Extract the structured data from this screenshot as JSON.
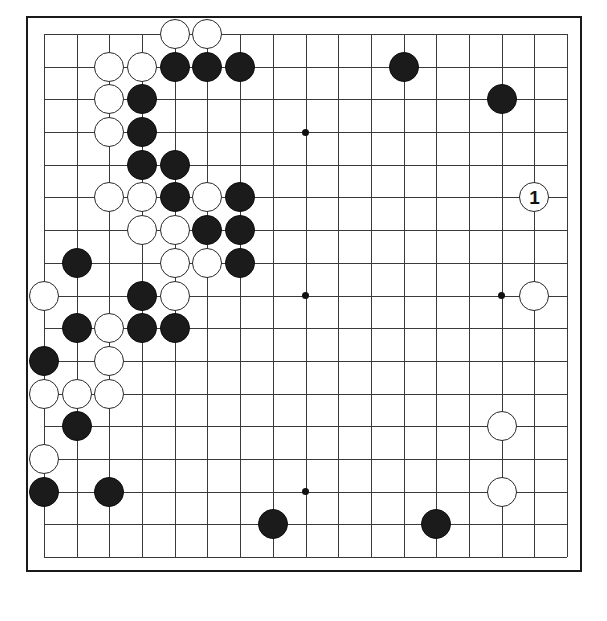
{
  "diagram": {
    "kind": "go-board-diagram",
    "board_size": 17,
    "title": "",
    "colors": {
      "board_background": "#ffffff",
      "grid_line": "#3a3a3a",
      "border": "#1a1a1a",
      "black_stone": "#1b1b1b",
      "white_stone": "#ffffff",
      "star_point": "#111111"
    },
    "geometry": {
      "left": 42,
      "top": 32,
      "spacing": 32.7,
      "lines": 17,
      "stone_diameter": 30
    },
    "star_points": [
      {
        "col": 8,
        "row": 3
      },
      {
        "col": 8,
        "row": 8
      },
      {
        "col": 14,
        "row": 8
      },
      {
        "col": 8,
        "row": 14
      }
    ],
    "move_number_label": "1",
    "stones": [
      {
        "col": 4,
        "row": 0,
        "color": "white"
      },
      {
        "col": 5,
        "row": 0,
        "color": "white"
      },
      {
        "col": 2,
        "row": 1,
        "color": "white"
      },
      {
        "col": 3,
        "row": 1,
        "color": "white"
      },
      {
        "col": 4,
        "row": 1,
        "color": "black"
      },
      {
        "col": 5,
        "row": 1,
        "color": "black"
      },
      {
        "col": 6,
        "row": 1,
        "color": "black"
      },
      {
        "col": 11,
        "row": 1,
        "color": "black"
      },
      {
        "col": 2,
        "row": 2,
        "color": "white"
      },
      {
        "col": 3,
        "row": 2,
        "color": "black"
      },
      {
        "col": 14,
        "row": 2,
        "color": "black"
      },
      {
        "col": 2,
        "row": 3,
        "color": "white"
      },
      {
        "col": 3,
        "row": 3,
        "color": "black"
      },
      {
        "col": 3,
        "row": 4,
        "color": "black"
      },
      {
        "col": 4,
        "row": 4,
        "color": "black"
      },
      {
        "col": 2,
        "row": 5,
        "color": "white"
      },
      {
        "col": 3,
        "row": 5,
        "color": "white"
      },
      {
        "col": 4,
        "row": 5,
        "color": "black"
      },
      {
        "col": 5,
        "row": 5,
        "color": "white"
      },
      {
        "col": 6,
        "row": 5,
        "color": "black"
      },
      {
        "col": 15,
        "row": 5,
        "color": "white",
        "label": "1"
      },
      {
        "col": 3,
        "row": 6,
        "color": "white"
      },
      {
        "col": 4,
        "row": 6,
        "color": "white"
      },
      {
        "col": 5,
        "row": 6,
        "color": "black"
      },
      {
        "col": 6,
        "row": 6,
        "color": "black"
      },
      {
        "col": 1,
        "row": 7,
        "color": "black"
      },
      {
        "col": 4,
        "row": 7,
        "color": "white"
      },
      {
        "col": 5,
        "row": 7,
        "color": "white"
      },
      {
        "col": 6,
        "row": 7,
        "color": "black"
      },
      {
        "col": 0,
        "row": 8,
        "color": "white"
      },
      {
        "col": 3,
        "row": 8,
        "color": "black"
      },
      {
        "col": 4,
        "row": 8,
        "color": "white"
      },
      {
        "col": 15,
        "row": 8,
        "color": "white"
      },
      {
        "col": 1,
        "row": 9,
        "color": "black"
      },
      {
        "col": 2,
        "row": 9,
        "color": "white"
      },
      {
        "col": 3,
        "row": 9,
        "color": "black"
      },
      {
        "col": 4,
        "row": 9,
        "color": "black"
      },
      {
        "col": 0,
        "row": 10,
        "color": "black"
      },
      {
        "col": 2,
        "row": 10,
        "color": "white"
      },
      {
        "col": 0,
        "row": 11,
        "color": "white"
      },
      {
        "col": 1,
        "row": 11,
        "color": "white"
      },
      {
        "col": 2,
        "row": 11,
        "color": "white"
      },
      {
        "col": 1,
        "row": 12,
        "color": "black"
      },
      {
        "col": 14,
        "row": 12,
        "color": "white"
      },
      {
        "col": 0,
        "row": 13,
        "color": "white"
      },
      {
        "col": 0,
        "row": 14,
        "color": "black"
      },
      {
        "col": 2,
        "row": 14,
        "color": "black"
      },
      {
        "col": 14,
        "row": 14,
        "color": "white"
      },
      {
        "col": 7,
        "row": 15,
        "color": "black"
      },
      {
        "col": 12,
        "row": 15,
        "color": "black"
      }
    ]
  }
}
